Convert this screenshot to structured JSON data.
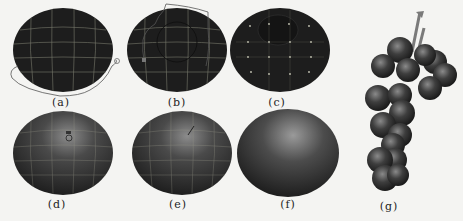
{
  "figure": {
    "panels": [
      {
        "id": "a",
        "label": "(a)",
        "description": "dark sphere with wireframe grid and freehand lasso selection around lower edge"
      },
      {
        "id": "b",
        "label": "(b)",
        "description": "dark sphere with wireframe grid and lasso selection around upper region"
      },
      {
        "id": "c",
        "label": "(c)",
        "description": "dark sphere with grid vertices and selected dark inner region at top"
      },
      {
        "id": "d",
        "label": "(d)",
        "description": "shaded sphere with grid and highlight tool cursor"
      },
      {
        "id": "e",
        "label": "(e)",
        "description": "shaded sphere with grid and highlight, pen cursor"
      },
      {
        "id": "f",
        "label": "(f)",
        "description": "final smooth shaded sphere with specular highlight"
      },
      {
        "id": "g",
        "label": "(g)",
        "description": "bunch of grapes composed of shaded spheres with stem"
      }
    ],
    "colors": {
      "sphere_dark": "#1c1c1c",
      "sphere_mid": "#3a3a3a",
      "highlight": "#8a8a8a",
      "grid": "#9a9a8a",
      "stem": "#8a8a8a",
      "background": "#f4f4f2"
    }
  }
}
